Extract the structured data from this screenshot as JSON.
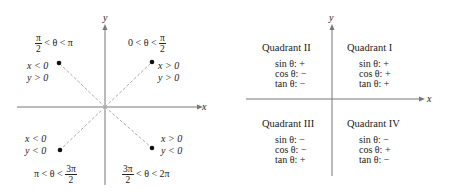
{
  "left_diagram": {
    "axis_x_label": "x",
    "axis_y_label": "y",
    "quadrants": [
      {
        "id": "Q1",
        "cond_x": "x > 0",
        "cond_y": "y > 0",
        "angle_left": "0 < θ <",
        "angle_frac_num": "π",
        "angle_frac_den": "2",
        "angle_right": ""
      },
      {
        "id": "Q2",
        "cond_x": "x < 0",
        "cond_y": "y > 0",
        "angle_frac_num": "π",
        "angle_frac_den": "2",
        "angle_right": "< θ <  π"
      },
      {
        "id": "Q3",
        "cond_x": "x < 0",
        "cond_y": "y < 0",
        "angle_left": "π < θ <",
        "angle_frac_num": "3π",
        "angle_frac_den": "2"
      },
      {
        "id": "Q4",
        "cond_x": "x > 0",
        "cond_y": "y < 0",
        "angle_frac_num": "3π",
        "angle_frac_den": "2",
        "angle_right": "< θ <  2π"
      }
    ]
  },
  "right_diagram": {
    "axis_x_label": "x",
    "axis_y_label": "y",
    "quadrants": [
      {
        "title": "Quadrant I",
        "sin": "sin θ:  +",
        "cos": "cos θ:  +",
        "tan": "tan θ:  +"
      },
      {
        "title": "Quadrant II",
        "sin": "sin θ:  +",
        "cos": "cos θ:  −",
        "tan": "tan θ:  −"
      },
      {
        "title": "Quadrant III",
        "sin": "sin θ:  −",
        "cos": "cos θ:  −",
        "tan": "tan θ:  +"
      },
      {
        "title": "Quadrant IV",
        "sin": "sin θ:  −",
        "cos": "cos θ:  +",
        "tan": "tan θ:  −"
      }
    ]
  }
}
